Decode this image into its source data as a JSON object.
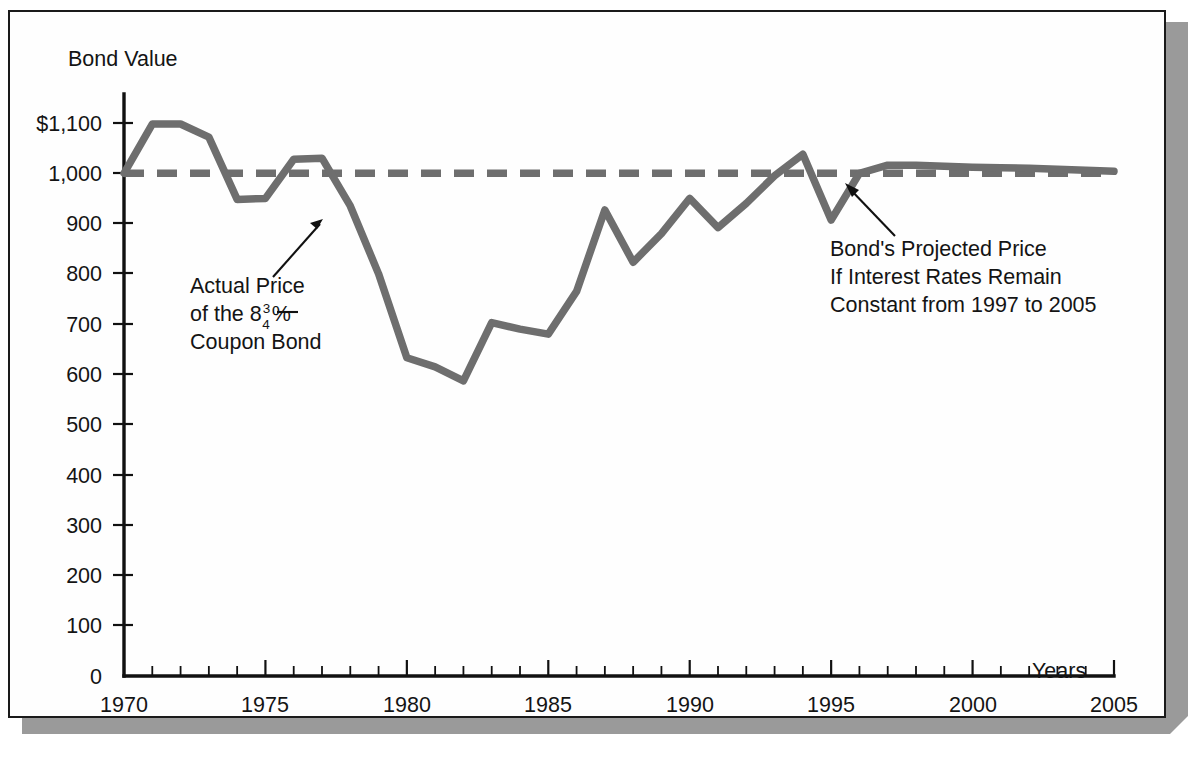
{
  "figure": {
    "background_color": "#fefefe",
    "frame_color": "#1a1a1a",
    "shadow_color": "#9a9a9a"
  },
  "chart_data": {
    "type": "line",
    "title": "",
    "subtitle": "",
    "ylabel": "Bond Value",
    "xlabel": "Years",
    "xlim": [
      1970,
      2005
    ],
    "ylim": [
      0,
      1100
    ],
    "grid": false,
    "legend_position": "none",
    "y_ticks": [
      0,
      100,
      200,
      300,
      400,
      500,
      600,
      700,
      800,
      900,
      1000,
      1100
    ],
    "y_tick_labels": [
      "0",
      "100",
      "200",
      "300",
      "400",
      "500",
      "600",
      "700",
      "800",
      "900",
      "1,000",
      "$1,100"
    ],
    "x_ticks": [
      1970,
      1975,
      1980,
      1985,
      1990,
      1995,
      2000,
      2005
    ],
    "x_tick_labels": [
      "1970",
      "1975",
      "1980",
      "1985",
      "1990",
      "1995",
      "2000",
      "2005"
    ],
    "x_minor_tick_step": 1,
    "series": [
      {
        "name": "Actual Price of the 8 3/4% Coupon Bond",
        "style": "solid",
        "color": "#6e6e6e",
        "x": [
          1970,
          1971,
          1972,
          1973,
          1974,
          1975,
          1976,
          1977,
          1978,
          1979,
          1980,
          1981,
          1982,
          1983,
          1984,
          1985,
          1986,
          1987,
          1988,
          1989,
          1990,
          1991,
          1992,
          1993,
          1994,
          1995,
          1996,
          1997,
          1998,
          1999,
          2000,
          2001,
          2002,
          2003,
          2004,
          2005
        ],
        "values": [
          1000,
          1098,
          1098,
          1072,
          948,
          950,
          1028,
          1030,
          935,
          800,
          633,
          615,
          587,
          703,
          690,
          680,
          765,
          927,
          823,
          880,
          950,
          892,
          940,
          995,
          1038,
          907,
          1000,
          1016,
          1016,
          1014,
          1012,
          1011,
          1010,
          1008,
          1006,
          1004
        ]
      },
      {
        "name": "Bond's Projected Price If Interest Rates Remain Constant from 1997 to 2005",
        "style": "dashed",
        "color": "#6e6e6e",
        "x": [
          1970,
          2005
        ],
        "values": [
          1000,
          1000
        ]
      }
    ],
    "annotations": [
      {
        "id": "actual-price-annotation",
        "lines": [
          "Actual Price",
          "of the 8",
          "Coupon Bond"
        ],
        "line1": "Actual Price",
        "line2_prefix": "of the 8",
        "line2_numerator": "3",
        "line2_denominator": "4",
        "line2_suffix": "%",
        "line3": "Coupon Bond",
        "points_to_year": 1977,
        "points_to_value": 930
      },
      {
        "id": "projected-price-annotation",
        "line1": "Bond's Projected Price",
        "line2": "If Interest Rates Remain",
        "line3": "Constant from 1997 to 2005",
        "points_to_year": 1998,
        "points_to_value": 1000
      }
    ]
  }
}
